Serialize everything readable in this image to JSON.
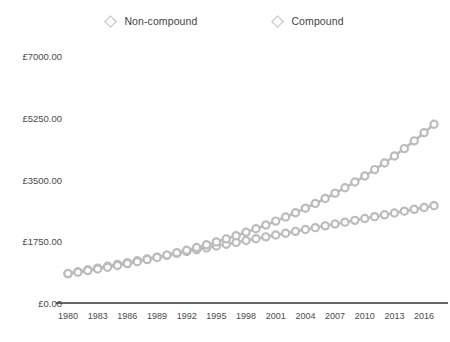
{
  "legend": {
    "position": "top-center",
    "items": [
      {
        "label": "Non-compound",
        "marker": "diamond-outline-icon",
        "color": "#bdbdbd"
      },
      {
        "label": "Compound",
        "marker": "diamond-outline-icon",
        "color": "#bdbdbd"
      }
    ]
  },
  "axis": {
    "y_ticks": [
      "£0.00",
      "£1750.00",
      "£3500.00",
      "£5250.00",
      "£7000.00"
    ],
    "x_ticks": [
      "1980",
      "1983",
      "1986",
      "1989",
      "1992",
      "1995",
      "1998",
      "2001",
      "2004",
      "2007",
      "2010",
      "2013",
      "2016"
    ]
  },
  "style": {
    "series_color": "#bcbcbc",
    "axis_color": "#333333",
    "background": "#ffffff",
    "text_color": "#4a4a4a"
  },
  "chart_data": {
    "type": "line",
    "title": "",
    "subtitle": "",
    "xlabel": "",
    "ylabel": "",
    "ylim": [
      0,
      7000
    ],
    "xlim": [
      1980,
      2017
    ],
    "grid": false,
    "legend_position": "top-center",
    "y_tick_values": [
      0,
      1750,
      3500,
      5250,
      7000
    ],
    "y_tick_labels": [
      "£0.00",
      "£1750.00",
      "£3500.00",
      "£5250.00",
      "£7000.00"
    ],
    "x_tick_values": [
      1980,
      1983,
      1986,
      1989,
      1992,
      1995,
      1998,
      2001,
      2004,
      2007,
      2010,
      2013,
      2016
    ],
    "x": [
      1980,
      1981,
      1982,
      1983,
      1984,
      1985,
      1986,
      1987,
      1988,
      1989,
      1990,
      1991,
      1992,
      1993,
      1994,
      1995,
      1996,
      1997,
      1998,
      1999,
      2000,
      2001,
      2002,
      2003,
      2004,
      2005,
      2006,
      2007,
      2008,
      2009,
      2010,
      2011,
      2012,
      2013,
      2014,
      2015,
      2016,
      2017
    ],
    "series": [
      {
        "name": "Non-compound",
        "marker": "circle-outline",
        "color": "#bcbcbc",
        "values": [
          833,
          885,
          937,
          989,
          1041,
          1093,
          1145,
          1197,
          1249,
          1301,
          1353,
          1406,
          1458,
          1510,
          1562,
          1614,
          1666,
          1718,
          1770,
          1822,
          1874,
          1926,
          1978,
          2030,
          2082,
          2135,
          2187,
          2239,
          2291,
          2343,
          2395,
          2447,
          2499,
          2551,
          2603,
          2655,
          2707,
          2759
        ]
      },
      {
        "name": "Compound",
        "marker": "circle-outline",
        "color": "#bcbcbc",
        "values": [
          833,
          875,
          918,
          964,
          1013,
          1063,
          1116,
          1172,
          1231,
          1292,
          1357,
          1425,
          1496,
          1571,
          1649,
          1732,
          1818,
          1909,
          2005,
          2105,
          2210,
          2321,
          2437,
          2559,
          2687,
          2821,
          2962,
          3110,
          3266,
          3429,
          3600,
          3780,
          3969,
          4168,
          4376,
          4595,
          4825,
          5066
        ]
      }
    ]
  }
}
